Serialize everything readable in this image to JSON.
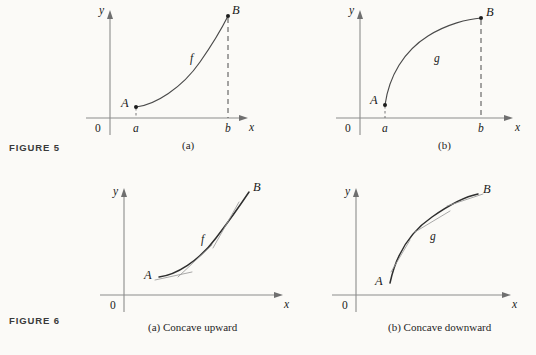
{
  "page": {
    "background_color": "#fbfaf7",
    "ink_color": "#1a1a1a",
    "axis_color": "#8c8c8c",
    "curve_color": "#4a4a4a",
    "tangent_color": "#9a9a9a"
  },
  "figures": [
    {
      "id": "figure-5",
      "label": "FIGURE 5",
      "panels": [
        {
          "id": "figure-5a",
          "caption": "(a)",
          "axis": {
            "x_label": "x",
            "y_label": "y",
            "origin_label": "0"
          },
          "tick_labels": {
            "left": "a",
            "right": "b"
          },
          "curve_label": "f",
          "point_start_label": "A",
          "point_end_label": "B",
          "shape": "increasing concave upward",
          "has_dashed_drop_from_B": true,
          "has_dashed_drop_from_A": true
        },
        {
          "id": "figure-5b",
          "caption": "(b)",
          "axis": {
            "x_label": "x",
            "y_label": "y",
            "origin_label": "0"
          },
          "tick_labels": {
            "left": "a",
            "right": "b"
          },
          "curve_label": "g",
          "point_start_label": "A",
          "point_end_label": "B",
          "shape": "increasing concave downward",
          "has_dashed_drop_from_B": true,
          "has_dashed_drop_from_A": true
        }
      ]
    },
    {
      "id": "figure-6",
      "label": "FIGURE 6",
      "panels": [
        {
          "id": "figure-6a",
          "caption": "(a) Concave upward",
          "axis": {
            "x_label": "x",
            "y_label": "y",
            "origin_label": "0"
          },
          "curve_label": "f",
          "point_start_label": "A",
          "point_end_label": "B",
          "shape": "increasing concave upward with tangent lines below curve",
          "tangent_count": 3
        },
        {
          "id": "figure-6b",
          "caption": "(b) Concave downward",
          "axis": {
            "x_label": "x",
            "y_label": "y",
            "origin_label": "0"
          },
          "curve_label": "g",
          "point_start_label": "A",
          "point_end_label": "B",
          "shape": "increasing concave downward with tangent lines above curve",
          "tangent_count": 3
        }
      ]
    }
  ]
}
